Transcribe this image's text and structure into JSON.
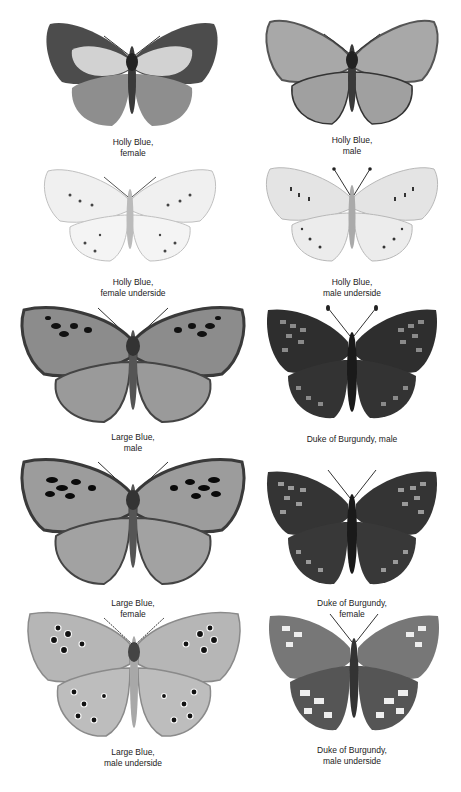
{
  "plate": {
    "background": "#ffffff",
    "specimens": [
      {
        "id": "holly-blue-female",
        "caption_line1": "Holly Blue,",
        "caption_line2": "female",
        "style": "upperside-dark-border",
        "fill": "#9a9a9a",
        "border": "#4a4a4a",
        "patch": "#d4d4d4"
      },
      {
        "id": "holly-blue-male",
        "caption_line1": "Holly Blue,",
        "caption_line2": "male",
        "style": "upperside-plain",
        "fill": "#a5a5a5",
        "border": "#3a3a3a",
        "patch": "#b3b3b3"
      },
      {
        "id": "holly-blue-female-underside",
        "caption_line1": "Holly Blue,",
        "caption_line2": "female underside",
        "style": "underside-pale",
        "fill": "#ececec",
        "border": "#c8c8c8",
        "patch": "#f6f6f6"
      },
      {
        "id": "holly-blue-male-underside",
        "caption_line1": "Holly Blue,",
        "caption_line2": "male underside",
        "style": "underside-pale",
        "fill": "#e2e2e2",
        "border": "#bdbdbd",
        "patch": "#f0f0f0"
      },
      {
        "id": "large-blue-male",
        "caption_line1": "Large Blue,",
        "caption_line2": "male",
        "style": "upperside-spotted",
        "fill": "#8e8e8e",
        "border": "#3f3f3f",
        "patch": "#a8a8a8"
      },
      {
        "id": "duke-of-burgundy-male",
        "caption_line1": "Duke of Burgundy, male",
        "caption_line2": "",
        "style": "checkered-dark",
        "fill": "#2f2f2f",
        "border": "#1a1a1a",
        "patch": "#8a8a8a"
      },
      {
        "id": "large-blue-female",
        "caption_line1": "Large Blue,",
        "caption_line2": "female",
        "style": "upperside-spotted",
        "fill": "#9c9c9c",
        "border": "#4a4a4a",
        "patch": "#c4c4c4"
      },
      {
        "id": "duke-of-burgundy-female",
        "caption_line1": "Duke of Burgundy,",
        "caption_line2": "female",
        "style": "checkered-dark",
        "fill": "#353535",
        "border": "#1c1c1c",
        "patch": "#9a9a9a"
      },
      {
        "id": "large-blue-male-underside",
        "caption_line1": "Large Blue,",
        "caption_line2": "male underside",
        "style": "underside-ocelli",
        "fill": "#b4b4b4",
        "border": "#8a8a8a",
        "patch": "#cccccc"
      },
      {
        "id": "duke-of-burgundy-male-underside",
        "caption_line1": "Duke of Burgundy,",
        "caption_line2": "male underside",
        "style": "checkered-light",
        "fill": "#6a6a6a",
        "border": "#3a3a3a",
        "patch": "#e8e8e8"
      }
    ]
  }
}
